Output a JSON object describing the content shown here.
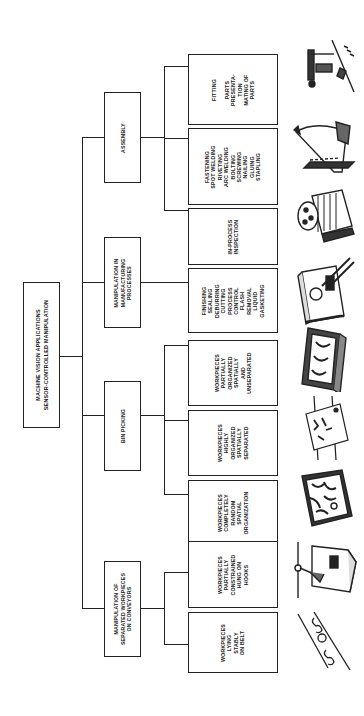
{
  "diagram": {
    "orientation": "rotated 90deg counterclockwise",
    "root": {
      "label": "MACHINE VISION APPLICATIONS\nSENSOR-CONTROLLED MANIPULATION"
    },
    "categories": [
      {
        "label": "ASSEMBLY",
        "children": [
          {
            "label": "FITTING\n\nPARTS\nPRESENTA-\nTION\nMATING OF\nPARTS",
            "illustration": "clamp-fitting-icon"
          },
          {
            "label": "FASTENING\nSPOT WELDING\nRIVETING\nARC WELDING\nBOLTING\nSCREWING\nNAILING\nGLUING\nSTAPLING",
            "illustration": "stapler-fastening-icon"
          },
          {
            "label": "IN-PROCESS\nINSPECTION",
            "illustration": "motor-inspection-icon"
          }
        ]
      },
      {
        "label": "MANIPULATION IN\nMANUFACTURING\nPROCESSES",
        "children": [
          {
            "label": "FINISHING\nSEALING\nDEBURRING\nCUTTING\nPROCESS\nCONTROL\nFLASH\nREMOVAL\nLIQUID\nGASKETING",
            "illustration": "box-finishing-icon"
          }
        ]
      },
      {
        "label": "BIN PICKING",
        "children": [
          {
            "label": "WORKPIECES\nPARTIALLY\nORGANIZED\nSPATIALLY\nAND\nUNSEPARATED",
            "illustration": "tray-partially-organized-icon"
          },
          {
            "label": "WORKPIECES\nHIGHLY\nORGANIZED\nSPATIALLY\nSEPARATED",
            "illustration": "rack-highly-organized-icon"
          },
          {
            "label": "WORKPIECES\nCOMPLETELY\nRANDOM\nSPATIAL\nORGANIZATION",
            "illustration": "bin-random-icon"
          }
        ]
      },
      {
        "label": "MANIPULATION OF\nSEPARATED WORKPIECES\nON CONVEYORS",
        "children": [
          {
            "label": "WORKPIECES\nPARTIALLY\nCONSTRAINED\nHUNG ON\nHOOKS",
            "illustration": "hook-hung-box-icon"
          },
          {
            "label": "WORKPIECES\nLYING\nSTABLY\nON BELT",
            "illustration": "conveyor-belt-icon"
          }
        ]
      }
    ]
  },
  "colors": {
    "line": "#222222",
    "background": "#ffffff",
    "text": "#1a1a1a"
  }
}
